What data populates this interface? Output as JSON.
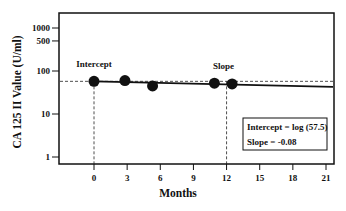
{
  "chart_data": {
    "type": "scatter",
    "title": "",
    "xlabel": "Months",
    "ylabel": "CA 125 II Value (U/ml)",
    "xscale": "linear",
    "yscale": "log",
    "xlim": [
      -3.5,
      21.5
    ],
    "ylim": [
      0.8,
      2000
    ],
    "x_ticks": [
      0,
      3,
      6,
      9,
      12,
      15,
      18,
      21
    ],
    "x_tick_labels": [
      "0",
      "3",
      "6",
      "9",
      "12",
      "15",
      "18",
      "21"
    ],
    "y_ticks": [
      1,
      10,
      100,
      500,
      1000
    ],
    "y_tick_labels": [
      "1",
      "10",
      "100",
      "500",
      "1000"
    ],
    "grid": false,
    "series": [
      {
        "name": "CA 125 II measurements",
        "x": [
          0,
          2.8,
          5.3,
          10.9,
          12.5
        ],
        "y": [
          57.5,
          60,
          45,
          52,
          50
        ]
      }
    ],
    "regression_line": {
      "intercept_label": "Intercept = log (57.5)",
      "slope_label": "Slope = -0.08",
      "intercept_value": 57.5,
      "slope": -0.08,
      "x_range": [
        0,
        21.5
      ]
    },
    "reference_lines": {
      "horizontal_dashed_at_y": 57.5,
      "vertical_dashed_at_x": [
        0,
        12
      ]
    },
    "annotations": [
      {
        "text": "Intercept",
        "x": 0,
        "y": 57.5
      },
      {
        "text": "Slope",
        "x": 12,
        "y": 57.5
      }
    ],
    "legend_box": {
      "lines": [
        "Intercept = log (57.5)",
        "Slope = -0.08"
      ],
      "position": "lower right"
    }
  }
}
